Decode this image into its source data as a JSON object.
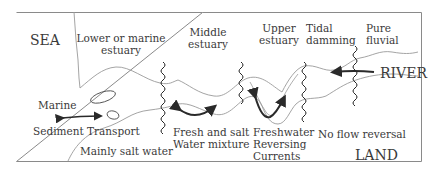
{
  "diagram": {
    "regions": {
      "sea": "SEA",
      "river": "RIVER",
      "land": "LAND"
    },
    "zones": [
      {
        "line1": "Lower or marine",
        "line2": "estuary"
      },
      {
        "line1": "Middle",
        "line2": "estuary"
      },
      {
        "line1": "Upper",
        "line2": "estuary"
      },
      {
        "line1": "Tidal",
        "line2": "damming"
      },
      {
        "line1": "Pure",
        "line2": "fluvial"
      }
    ],
    "processes": {
      "marine": "Marine",
      "sediment": "Sediment Transport",
      "salt_water": "Mainly salt water",
      "mixture_1": "Fresh and salt",
      "mixture_2": "Water mixture",
      "fresh_1": "Freshwater",
      "fresh_2": "Reversing",
      "fresh_3": "Currents",
      "no_reversal": "No flow reversal"
    },
    "colors": {
      "line": "#9a9a9a",
      "arrow": "#2a2a2a",
      "text": "#3a3a3a",
      "frame": "#8a8a8a"
    }
  }
}
